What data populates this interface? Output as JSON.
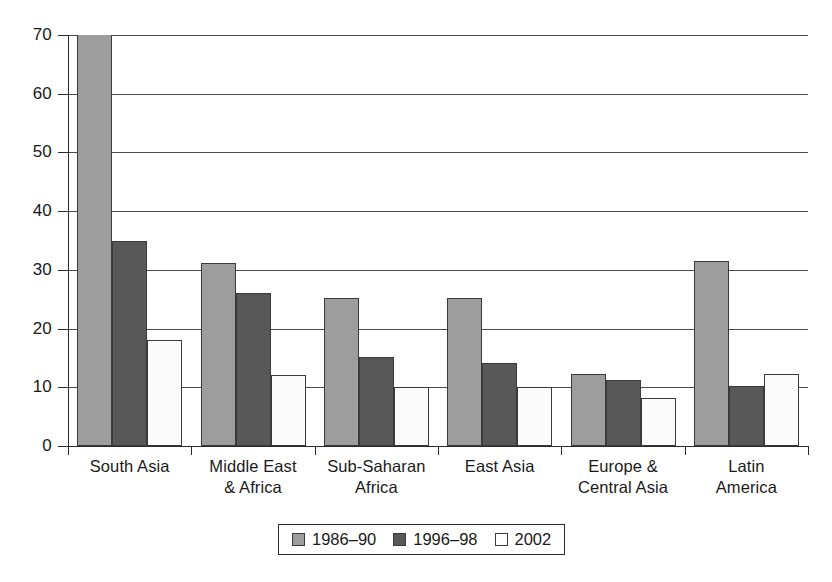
{
  "chart_data": {
    "type": "bar",
    "title": "",
    "subtitle": "",
    "xlabel": "",
    "ylabel": "",
    "ylim": [
      0,
      70
    ],
    "ytick_values": [
      0,
      10,
      20,
      30,
      40,
      50,
      60,
      70
    ],
    "ytick_labels": [
      "0",
      "10",
      "20",
      "30",
      "40",
      "50",
      "60",
      "70"
    ],
    "grid": true,
    "legend_position": "bottom",
    "categories": [
      "South Asia",
      "Middle East & Africa",
      "Sub-Saharan Africa",
      "East Asia",
      "Europe & Central Asia",
      "Latin America"
    ],
    "category_lines": [
      [
        "South Asia",
        ""
      ],
      [
        "Middle East",
        "& Africa"
      ],
      [
        "Sub-Saharan",
        "Africa"
      ],
      [
        "East Asia",
        ""
      ],
      [
        "Europe &",
        "Central Asia"
      ],
      [
        "Latin",
        "America"
      ]
    ],
    "series": [
      {
        "name": "1986–90",
        "color": "#9d9d9d",
        "values": [
          70,
          31.2,
          25.2,
          25.2,
          12.2,
          31.5
        ],
        "clipped": [
          true,
          false,
          false,
          false,
          false,
          false
        ]
      },
      {
        "name": "1996–98",
        "color": "#585858",
        "values": [
          35,
          26.1,
          15.1,
          14.2,
          11.2,
          10.3
        ],
        "clipped": [
          false,
          false,
          false,
          false,
          false,
          false
        ]
      },
      {
        "name": "2002",
        "color": "#ffffff",
        "values": [
          18,
          12.1,
          10.1,
          10.1,
          8.2,
          12.3
        ],
        "clipped": [
          false,
          false,
          false,
          false,
          false,
          false
        ]
      }
    ]
  },
  "legend": {
    "items": [
      {
        "label": "1986–90",
        "swatch": "light-gray"
      },
      {
        "label": "1996–98",
        "swatch": "dark-gray"
      },
      {
        "label": "2002",
        "swatch": "white"
      }
    ]
  },
  "colors": {
    "series_1986_90": "#9d9d9d",
    "series_1996_98": "#585858",
    "series_2002": "#ffffff",
    "axis": "#2a2a2a",
    "gridline": "#4a4a4a",
    "background": "#ffffff"
  }
}
